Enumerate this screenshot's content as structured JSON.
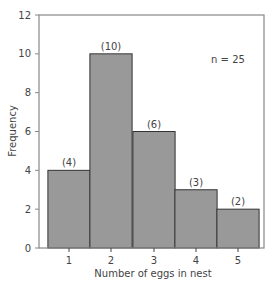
{
  "chart_data": {
    "type": "bar",
    "title": "",
    "xlabel": "Number of eggs in nest",
    "ylabel": "Frequency",
    "categories": [
      "1",
      "2",
      "3",
      "4",
      "5"
    ],
    "values": [
      4,
      10,
      6,
      3,
      2
    ],
    "value_labels": [
      "(4)",
      "(10)",
      "(6)",
      "(3)",
      "(2)"
    ],
    "ylim": [
      0,
      12
    ],
    "yticks": [
      0,
      2,
      4,
      6,
      8,
      10,
      12
    ],
    "grid": false,
    "annotation": "n = 25",
    "bar_color": "#999999",
    "bar_edge_color": "#333333",
    "axis_color": "#888888"
  }
}
